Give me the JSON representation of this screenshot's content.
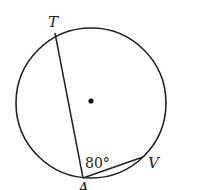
{
  "diagram": {
    "type": "circle-inscribed-angle",
    "points": {
      "T": {
        "label": "T"
      },
      "A": {
        "label": "A"
      },
      "V": {
        "label": "V"
      }
    },
    "angle_label": "80°",
    "center_dot": true
  }
}
